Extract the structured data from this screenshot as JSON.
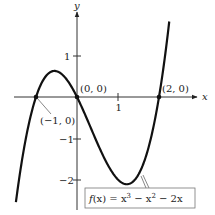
{
  "chart_data": {
    "type": "line",
    "title": "",
    "function_label": "f(x) = x³ − x² − 2x",
    "xlabel": "x",
    "ylabel": "y",
    "xlim": [
      -1.49,
      2.25
    ],
    "ylim": [
      -2.5,
      1.83
    ],
    "x_ticks": [
      {
        "value": 1,
        "label": "1"
      }
    ],
    "y_ticks": [
      {
        "value": 1,
        "label": "1"
      },
      {
        "value": -1,
        "label": "−1"
      },
      {
        "value": -2,
        "label": "−2"
      }
    ],
    "grid": false,
    "points": [
      {
        "x": -1,
        "y": 0,
        "label": "(−1, 0)"
      },
      {
        "x": 0,
        "y": 0,
        "label": "(0, 0)"
      },
      {
        "x": 2,
        "y": 0,
        "label": "(2, 0)"
      }
    ],
    "series": [
      {
        "name": "f(x) = x^3 - x^2 - 2x",
        "coefficients": [
          1,
          -1,
          -2,
          0
        ],
        "x_range": [
          -1.49,
          2.25
        ]
      }
    ]
  },
  "labels": {
    "x_axis": "x",
    "y_axis": "y",
    "tick_x1": "1",
    "tick_y1": "1",
    "tick_ym1": "−1",
    "tick_ym2": "−2",
    "pt_neg1": "(−1, 0)",
    "pt_0": "(0, 0)",
    "pt_2": "(2, 0)",
    "fn_f": "f",
    "fn_rest": "(x) = x",
    "fn_exp1": "3",
    "fn_mid": " − x",
    "fn_exp2": "2",
    "fn_end": " − 2x"
  }
}
